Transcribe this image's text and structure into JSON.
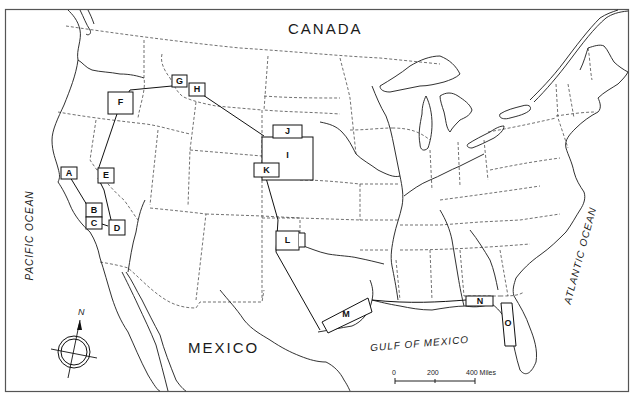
{
  "map": {
    "frame": {
      "x": 5,
      "y": 9,
      "w": 624,
      "h": 383
    },
    "colors": {
      "background": "#ffffff",
      "ink": "#1a1a1a",
      "border": "#555555"
    },
    "labels": {
      "canada": "CANADA",
      "mexico": "MEXICO",
      "pacific_ocean": "PACIFIC OCEAN",
      "atlantic_ocean": "ATLANTIC OCEAN",
      "gulf_of_mexico": "GULF OF MEXICO"
    },
    "compass": {
      "north_label": "N"
    },
    "scale_bar": {
      "ticks": [
        "0",
        "200",
        "400 Miles"
      ]
    },
    "study_areas": [
      {
        "id": "A",
        "label": "A"
      },
      {
        "id": "B",
        "label": "B"
      },
      {
        "id": "C",
        "label": "C"
      },
      {
        "id": "D",
        "label": "D"
      },
      {
        "id": "E",
        "label": "E"
      },
      {
        "id": "F",
        "label": "F"
      },
      {
        "id": "G",
        "label": "G"
      },
      {
        "id": "H",
        "label": "H"
      },
      {
        "id": "I",
        "label": "I"
      },
      {
        "id": "J",
        "label": "J"
      },
      {
        "id": "K",
        "label": "K"
      },
      {
        "id": "L",
        "label": "L"
      },
      {
        "id": "M",
        "label": "M"
      },
      {
        "id": "N",
        "label": "N"
      },
      {
        "id": "O",
        "label": "O"
      }
    ]
  }
}
